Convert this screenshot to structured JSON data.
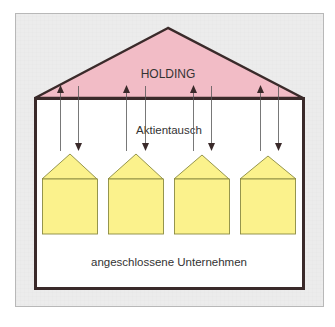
{
  "diagram": {
    "type": "holding-structure",
    "colors": {
      "frame_fill": "#ececec",
      "frame_stroke": "#b8b8b8",
      "roof_fill": "#f2bcc6",
      "outline": "#3a2a2a",
      "body_fill": "#ffffff",
      "company_fill": "#fbf28c",
      "company_stroke": "#8a8a40",
      "arrow": "#444444",
      "text": "#333333"
    },
    "labels": {
      "holding": "HOLDING",
      "exchange": "Aktientausch",
      "companies": "angeschlossene Unternehmen"
    },
    "companies": [
      {
        "name": "company-1"
      },
      {
        "name": "company-2"
      },
      {
        "name": "company-3"
      },
      {
        "name": "company-4"
      }
    ],
    "arrows": {
      "up_count": 4,
      "down_count": 4,
      "meaning": "share exchange between holding and affiliated companies"
    }
  }
}
